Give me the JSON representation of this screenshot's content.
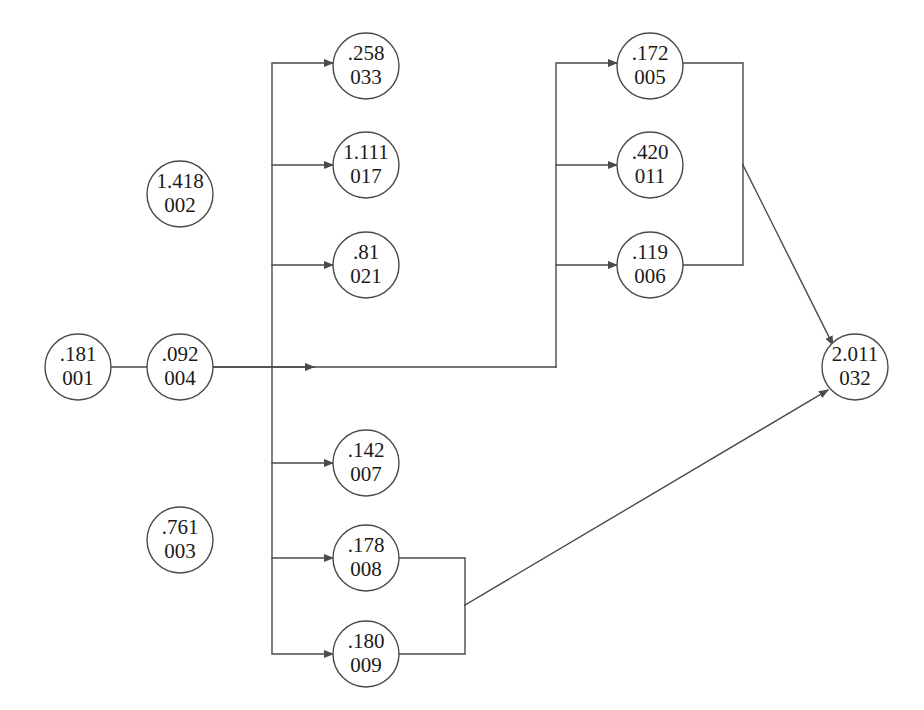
{
  "diagram": {
    "type": "node-link-graph",
    "colors": {
      "stroke": "#4a4a4a",
      "node_fill": "#ffffff",
      "text": "#1a1a1a",
      "background": "#ffffff"
    },
    "node_radius": 33,
    "nodes": [
      {
        "id": "001",
        "value": ".181",
        "label": "001",
        "cx": 78,
        "cy": 367
      },
      {
        "id": "004",
        "value": ".092",
        "label": "004",
        "cx": 180,
        "cy": 367
      },
      {
        "id": "002",
        "value": "1.418",
        "label": "002",
        "cx": 180,
        "cy": 194
      },
      {
        "id": "003",
        "value": ".761",
        "label": "003",
        "cx": 180,
        "cy": 540
      },
      {
        "id": "033",
        "value": ".258",
        "label": "033",
        "cx": 366,
        "cy": 66
      },
      {
        "id": "017",
        "value": "1.111",
        "label": "017",
        "cx": 366,
        "cy": 165
      },
      {
        "id": "021",
        "value": ".81",
        "label": "021",
        "cx": 366,
        "cy": 265
      },
      {
        "id": "007",
        "value": ".142",
        "label": "007",
        "cx": 366,
        "cy": 463
      },
      {
        "id": "008",
        "value": ".178",
        "label": "008",
        "cx": 366,
        "cy": 558
      },
      {
        "id": "009",
        "value": ".180",
        "label": "009",
        "cx": 366,
        "cy": 654
      },
      {
        "id": "005",
        "value": ".172",
        "label": "005",
        "cx": 650,
        "cy": 66
      },
      {
        "id": "011",
        "value": ".420",
        "label": "011",
        "cx": 650,
        "cy": 165
      },
      {
        "id": "006",
        "value": ".119",
        "label": "006",
        "cx": 650,
        "cy": 265
      },
      {
        "id": "032",
        "value": "2.011",
        "label": "032",
        "cx": 855,
        "cy": 367
      }
    ],
    "edges": [
      {
        "from": "001",
        "to": "004",
        "path": "M 111 367 L 314 367",
        "arrow": true
      },
      {
        "from": "004",
        "to": "bus-left",
        "path": "M 213 367 L 556 367",
        "arrow": false
      },
      {
        "from": "bus-left",
        "to": "033",
        "path": "M 272 367 L 272 63 L 333 63",
        "arrow": true
      },
      {
        "from": "bus-left",
        "to": "017",
        "path": "M 272 165 L 333 165",
        "arrow": true
      },
      {
        "from": "bus-left",
        "to": "021",
        "path": "M 272 265 L 333 265",
        "arrow": true
      },
      {
        "from": "bus-left",
        "to": "009",
        "path": "M 272 367 L 272 654 L 333 654",
        "arrow": true
      },
      {
        "from": "bus-left",
        "to": "007",
        "path": "M 272 463 L 333 463",
        "arrow": true
      },
      {
        "from": "bus-left",
        "to": "008",
        "path": "M 272 558 L 333 558",
        "arrow": true
      },
      {
        "from": "bus-mid",
        "to": "005",
        "path": "M 556 367 L 556 63 L 617 63",
        "arrow": true
      },
      {
        "from": "bus-mid",
        "to": "011",
        "path": "M 556 165 L 617 165",
        "arrow": true
      },
      {
        "from": "bus-mid",
        "to": "006",
        "path": "M 556 265 L 617 265",
        "arrow": true
      },
      {
        "from": "005",
        "to": "bus-right",
        "path": "M 683 63 L 743 63 L 743 165",
        "arrow": false
      },
      {
        "from": "006",
        "to": "bus-right",
        "path": "M 683 265 L 743 265 L 743 165",
        "arrow": false
      },
      {
        "from": "bus-right",
        "to": "032",
        "path": "M 743 165 L 833 345",
        "arrow": true
      },
      {
        "from": "008",
        "to": "bus-bottom",
        "path": "M 399 558 L 465 558 L 465 605",
        "arrow": false
      },
      {
        "from": "009",
        "to": "bus-bottom",
        "path": "M 399 654 L 465 654 L 465 605",
        "arrow": false
      },
      {
        "from": "bus-bottom",
        "to": "032",
        "path": "M 465 605 L 828 390",
        "arrow": true
      }
    ]
  }
}
